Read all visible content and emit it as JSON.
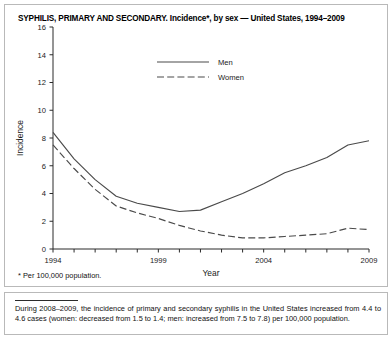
{
  "title": "SYPHILIS, PRIMARY AND SECONDARY. Incidence*, by sex — United States, 1994–2009",
  "footnote": "* Per 100,000 population.",
  "note": {
    "text": "During 2008–2009, the incidence of primary and secondary syphilis in the United States increased from 4.4 to 4.6 cases (women: decreased from 1.5 to 1.4; men: increased from 7.5 to 7.8) per 100,000 population."
  },
  "colors": {
    "line": "#4a4a4a",
    "axis": "#2b2b2b",
    "frame": "#b9b9b9",
    "background": "#ffffff"
  },
  "chart_data": {
    "type": "line",
    "title": "SYPHILIS, PRIMARY AND SECONDARY. Incidence*, by sex — United States, 1994–2009",
    "xlabel": "Year",
    "ylabel": "Incidence",
    "xlim": [
      1994,
      2009
    ],
    "ylim": [
      0,
      16
    ],
    "yticks": [
      0,
      2,
      4,
      6,
      8,
      10,
      12,
      14,
      16
    ],
    "ytick_labels": [
      "0",
      "2",
      "4",
      "6",
      "8",
      "10",
      "12",
      "14",
      "16"
    ],
    "xticks": [
      1994,
      1995,
      1996,
      1997,
      1998,
      1999,
      2000,
      2001,
      2002,
      2003,
      2004,
      2005,
      2006,
      2007,
      2008,
      2009
    ],
    "xtick_labels_shown": [
      "1994",
      "1999",
      "2004",
      "2009"
    ],
    "xtick_labels_shown_at": [
      1994,
      1999,
      2004,
      2009
    ],
    "grid": false,
    "legend_position": "upper-center",
    "x": [
      1994,
      1995,
      1996,
      1997,
      1998,
      1999,
      2000,
      2001,
      2002,
      2003,
      2004,
      2005,
      2006,
      2007,
      2008,
      2009
    ],
    "series": [
      {
        "name": "Men",
        "style": "solid",
        "values": [
          8.4,
          6.5,
          5.0,
          3.8,
          3.3,
          3.0,
          2.7,
          2.8,
          3.4,
          4.0,
          4.7,
          5.5,
          6.0,
          6.6,
          7.5,
          7.8
        ]
      },
      {
        "name": "Women",
        "style": "dashed",
        "values": [
          7.5,
          5.8,
          4.3,
          3.1,
          2.6,
          2.2,
          1.7,
          1.3,
          1.0,
          0.8,
          0.8,
          0.9,
          1.0,
          1.1,
          1.5,
          1.4
        ]
      }
    ]
  }
}
